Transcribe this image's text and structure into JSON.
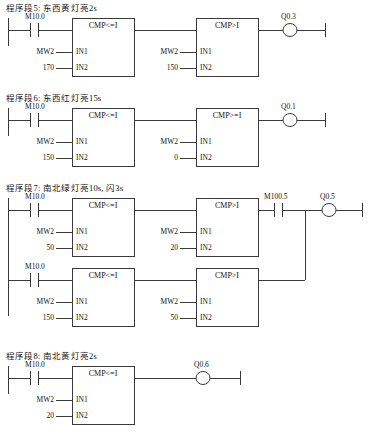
{
  "document": {
    "type": "plc-ladder-diagram",
    "language": "LAD",
    "line_color": "#3a3a3a"
  },
  "networks": [
    {
      "id": "network-5",
      "title": "程序段5:  东西黄灯亮2s",
      "branches": [
        {
          "contacts": [
            {
              "type": "NO",
              "address": "M10.0"
            }
          ],
          "blocks": [
            {
              "name": "CMP<=I",
              "in1": "MW2",
              "in2": "170"
            },
            {
              "name": "CMP>I",
              "in1": "MW2",
              "in2": "150"
            }
          ],
          "coil": "Q0.3"
        }
      ]
    },
    {
      "id": "network-6",
      "title": "程序段6:  东西红灯亮15s",
      "branches": [
        {
          "contacts": [
            {
              "type": "NO",
              "address": "M10.0"
            }
          ],
          "blocks": [
            {
              "name": "CMP<=I",
              "in1": "MW2",
              "in2": "150"
            },
            {
              "name": "CMP>=I",
              "in1": "MW2",
              "in2": "0"
            }
          ],
          "coil": "Q0.1"
        }
      ]
    },
    {
      "id": "network-7",
      "title": "程序段7:  南北绿灯亮10s, 闪3s",
      "branches": [
        {
          "contacts": [
            {
              "type": "NO",
              "address": "M10.0"
            }
          ],
          "blocks": [
            {
              "name": "CMP<=I",
              "in1": "MW2",
              "in2": "50"
            },
            {
              "name": "CMP>I",
              "in1": "MW2",
              "in2": "20"
            }
          ],
          "series_contact": {
            "type": "NO",
            "address": "M100.5"
          },
          "coil": "Q0.5"
        },
        {
          "contacts": [
            {
              "type": "NO",
              "address": "M10.0"
            }
          ],
          "blocks": [
            {
              "name": "CMP<=I",
              "in1": "MW2",
              "in2": "150"
            },
            {
              "name": "CMP>I",
              "in1": "MW2",
              "in2": "50"
            }
          ]
        }
      ]
    },
    {
      "id": "network-8",
      "title": "程序段8:  南北黄灯亮2s",
      "branches": [
        {
          "contacts": [
            {
              "type": "NO",
              "address": "M10.0"
            }
          ],
          "blocks": [
            {
              "name": "CMP<=I",
              "in1": "MW2",
              "in2": "20"
            }
          ],
          "coil": "Q0.6"
        }
      ]
    }
  ],
  "pins": {
    "in1": "IN1",
    "in2": "IN2"
  }
}
